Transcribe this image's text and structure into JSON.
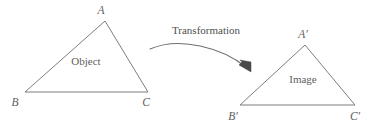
{
  "diagram": {
    "background_color": "#ffffff",
    "line_color": "#7d7d7d",
    "text_color": "#5e5e5e",
    "arrow_color": "#4a4a4a"
  },
  "object_shape": {
    "region_label": "Object",
    "vertices": [
      {
        "name": "A",
        "label": "A",
        "x": 105,
        "y": 21
      },
      {
        "name": "B",
        "label": "B",
        "x": 25,
        "y": 92
      },
      {
        "name": "C",
        "label": "C",
        "x": 148,
        "y": 92
      }
    ]
  },
  "image_shape": {
    "region_label": "Image",
    "vertices": [
      {
        "name": "A-prime",
        "label": "A′",
        "x": 305,
        "y": 45
      },
      {
        "name": "B-prime",
        "label": "B′",
        "x": 240,
        "y": 105
      },
      {
        "name": "C-prime",
        "label": "C′",
        "x": 355,
        "y": 105
      }
    ]
  },
  "arrow": {
    "label": "Transformation",
    "direction": "left-to-right"
  }
}
